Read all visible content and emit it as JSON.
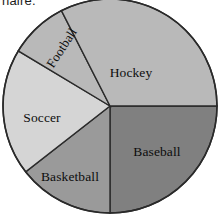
{
  "page": {
    "width": 224,
    "height": 220,
    "background": "#ffffff",
    "clipped_heading": "naire."
  },
  "chart": {
    "center_x": 110,
    "center_y": 106,
    "radius": 107,
    "outline_color": "#2a2a2a"
  },
  "chart_data": {
    "type": "pie",
    "title": "",
    "subtitle": "",
    "xlabel": "",
    "ylabel": "",
    "legend": "none",
    "grid": false,
    "labels_inside": true,
    "start_angle_deg": 0,
    "direction": "clockwise",
    "categories": [
      "Baseball",
      "Basketball",
      "Soccer",
      "Football",
      "Hockey"
    ],
    "values": [
      25,
      14.5,
      19,
      9,
      32.5
    ],
    "units": "percent",
    "slices": [
      {
        "name": "Baseball",
        "label": "Baseball",
        "percent": 25,
        "start_angle_deg": 0,
        "end_angle_deg": 90,
        "color": "#808080",
        "label_x": 157,
        "label_y": 152,
        "rotation_deg": 0
      },
      {
        "name": "Basketball",
        "label": "Basketball",
        "percent": 14.5,
        "start_angle_deg": 90,
        "end_angle_deg": 142,
        "color": "#9a9a9a",
        "label_x": 70,
        "label_y": 177,
        "rotation_deg": 0
      },
      {
        "name": "Soccer",
        "label": "Soccer",
        "percent": 19,
        "start_angle_deg": 142,
        "end_angle_deg": 211,
        "color": "#d5d5d5",
        "label_x": 42,
        "label_y": 118,
        "rotation_deg": 0
      },
      {
        "name": "Football",
        "label": "Football",
        "percent": 9,
        "start_angle_deg": 211,
        "end_angle_deg": 243,
        "color": "#b9b9b9",
        "label_x": 62,
        "label_y": 48,
        "rotation_deg": -57
      },
      {
        "name": "Hockey",
        "label": "Hockey",
        "percent": 32.5,
        "start_angle_deg": 243,
        "end_angle_deg": 360,
        "color": "#b9b9b9",
        "label_x": 131,
        "label_y": 73,
        "rotation_deg": 0
      }
    ]
  }
}
